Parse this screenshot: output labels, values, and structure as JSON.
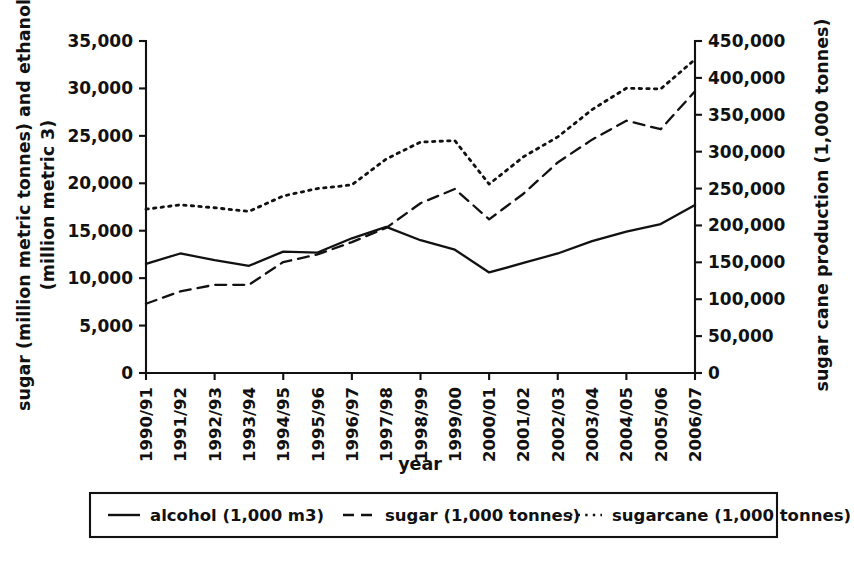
{
  "chart_data": {
    "type": "line",
    "title": "",
    "xlabel": "year",
    "ylabel": "sugar (million metric tonnes) and ethanol (million metric 3)",
    "ylabel_right": "sugar cane production (1,000 tonnes)",
    "grid": false,
    "legend_position": "bottom",
    "categories": [
      "1990/91",
      "1991/92",
      "1992/93",
      "1993/94",
      "1994/95",
      "1995/96",
      "1996/97",
      "1997/98",
      "1998/99",
      "1999/00",
      "2000/01",
      "2001/02",
      "2002/03",
      "2003/04",
      "2004/05",
      "2005/06",
      "2006/07"
    ],
    "ylim": [
      0,
      35000
    ],
    "yticks": [
      0,
      5000,
      10000,
      15000,
      20000,
      25000,
      30000,
      35000
    ],
    "ytick_labels": [
      "0",
      "5,000",
      "10,000",
      "15,000",
      "20,000",
      "25,000",
      "30,000",
      "35,000"
    ],
    "ylim_right": [
      0,
      450000
    ],
    "yticks_right": [
      0,
      50000,
      100000,
      150000,
      200000,
      250000,
      300000,
      350000,
      400000,
      450000
    ],
    "ytick_labels_right": [
      "0",
      "50,000",
      "100,000",
      "150,000",
      "200,000",
      "250,000",
      "300,000",
      "350,000",
      "400,000",
      "450,000"
    ],
    "series": [
      {
        "name": "alcohol (1,000 m3)",
        "style": "solid",
        "axis": "left",
        "values": [
          11500,
          12600,
          11900,
          11300,
          12800,
          12700,
          14200,
          15400,
          14000,
          13000,
          10600,
          11600,
          12600,
          13900,
          14900,
          15700,
          17700
        ]
      },
      {
        "name": "sugar (1,000 tonnes)",
        "style": "dashed",
        "axis": "left",
        "values": [
          7300,
          8600,
          9300,
          9300,
          11700,
          12500,
          13800,
          15300,
          17900,
          19400,
          16200,
          18900,
          22200,
          24600,
          26600,
          25700,
          29700
        ]
      },
      {
        "name": "sugarcane (1,000 tonnes)",
        "style": "dotted",
        "axis": "right",
        "values": [
          222000,
          228000,
          224000,
          219000,
          240000,
          250000,
          255000,
          290000,
          313000,
          315000,
          256000,
          293000,
          320000,
          357000,
          386000,
          385000,
          425000
        ]
      }
    ]
  },
  "legend": {
    "entries": [
      {
        "label": "alcohol (1,000 m3)",
        "style": "solid"
      },
      {
        "label": "sugar (1,000 tonnes)",
        "style": "dashed"
      },
      {
        "label": "sugarcane (1,000 tonnes)",
        "style": "dotted"
      }
    ]
  }
}
